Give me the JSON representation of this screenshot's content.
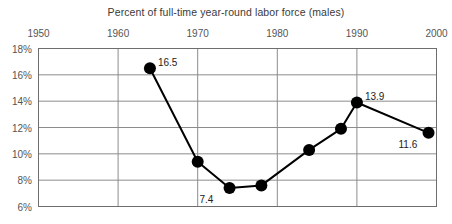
{
  "chart_data": {
    "type": "line",
    "title": "Percent of full-time year-round labor force (males)",
    "xlabel": "",
    "ylabel": "",
    "xlim": [
      1950,
      2000
    ],
    "ylim": [
      6,
      18
    ],
    "grid": true,
    "legend": "none",
    "x_ticks": [
      "1950",
      "1960",
      "1970",
      "1980",
      "1990",
      "2000"
    ],
    "x_tick_values": [
      1950,
      1960,
      1970,
      1980,
      1990,
      2000
    ],
    "y_ticks": [
      "18%",
      "16%",
      "14%",
      "12%",
      "10%",
      "8%",
      "6%"
    ],
    "y_tick_values": [
      18,
      16,
      14,
      12,
      10,
      8,
      6
    ],
    "x": [
      1964,
      1970,
      1974,
      1978,
      1984,
      1988,
      1990,
      1999
    ],
    "values": [
      16.5,
      9.4,
      7.4,
      7.6,
      10.3,
      11.9,
      13.9,
      11.6
    ],
    "points": [
      {
        "x": 1964,
        "y": 16.5,
        "label": "16.5",
        "label_pos": "right"
      },
      {
        "x": 1970,
        "y": 9.4,
        "label": "",
        "label_pos": "none"
      },
      {
        "x": 1974,
        "y": 7.4,
        "label": "7.4",
        "label_pos": "below-left"
      },
      {
        "x": 1978,
        "y": 7.6,
        "label": "",
        "label_pos": "none"
      },
      {
        "x": 1984,
        "y": 10.3,
        "label": "",
        "label_pos": "none"
      },
      {
        "x": 1988,
        "y": 11.9,
        "label": "",
        "label_pos": "none"
      },
      {
        "x": 1990,
        "y": 13.9,
        "label": "13.9",
        "label_pos": "right"
      },
      {
        "x": 1999,
        "y": 11.6,
        "label": "11.6",
        "label_pos": "below-left"
      }
    ],
    "marker": "circle",
    "marker_color": "#000000",
    "line_color": "#000000",
    "grid_color": "#8c8c8c",
    "frame_color": "#6e6e6e"
  }
}
